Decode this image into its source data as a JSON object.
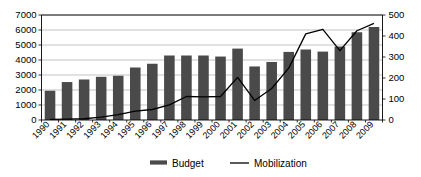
{
  "chart_data": {
    "type": "bar",
    "title": "",
    "subtitle": "",
    "xlabel": "",
    "ylabel": "",
    "y2label": "",
    "grid": true,
    "legend_position": "bottom",
    "categories": [
      "1990",
      "1991",
      "1992",
      "1993",
      "1994",
      "1995",
      "1996",
      "1997",
      "1998",
      "1999",
      "2000",
      "2001",
      "2002",
      "2003",
      "2004",
      "2005",
      "2006",
      "2007",
      "2008",
      "2009"
    ],
    "ylim": [
      0,
      7000
    ],
    "y_ticks": [
      "0",
      "1000",
      "2000",
      "3000",
      "4000",
      "5000",
      "6000",
      "7000"
    ],
    "y2lim": [
      0,
      500
    ],
    "y2_ticks": [
      "0",
      "100",
      "200",
      "300",
      "400",
      "500"
    ],
    "series": [
      {
        "name": "Budget",
        "type": "bar",
        "axis": "left",
        "color": "#4a4a4a",
        "values": [
          1950,
          2530,
          2700,
          2880,
          2950,
          3500,
          3750,
          4300,
          4300,
          4300,
          4230,
          4760,
          3570,
          3870,
          4540,
          4700,
          4560,
          4900,
          5850,
          6200
        ]
      },
      {
        "name": "Mobilization",
        "type": "line",
        "axis": "right",
        "color": "#000000",
        "values": [
          3,
          4,
          6,
          14,
          26,
          42,
          50,
          72,
          112,
          110,
          112,
          203,
          93,
          150,
          247,
          410,
          432,
          330,
          425,
          460
        ]
      }
    ],
    "legend": [
      {
        "label": "Budget",
        "marker": "bar-swatch",
        "color": "#4a4a4a"
      },
      {
        "label": "Mobilization",
        "marker": "line-swatch",
        "color": "#000000"
      }
    ]
  }
}
